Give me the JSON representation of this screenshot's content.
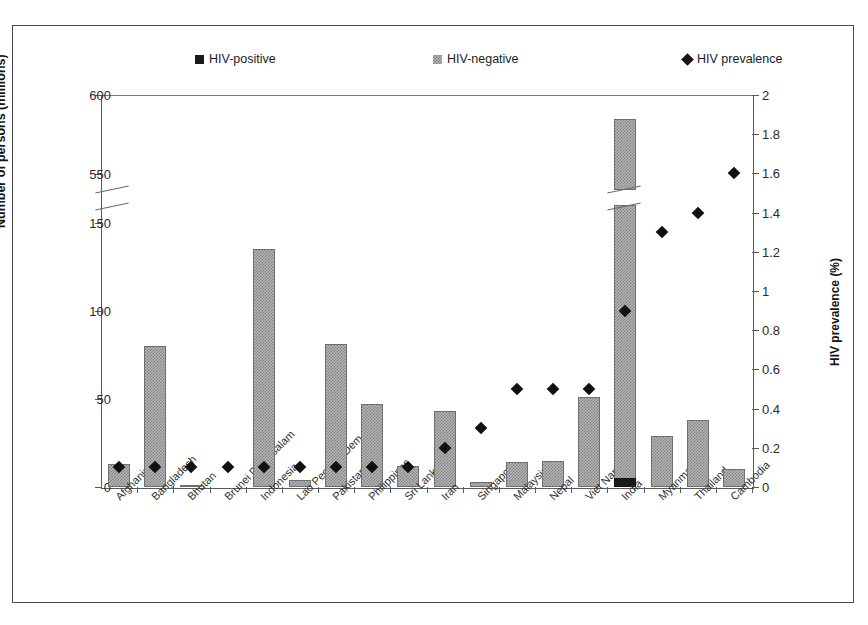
{
  "legend": {
    "items": [
      {
        "label": "HIV-positive",
        "icon": "black-square-icon",
        "color": "#1a1a1a"
      },
      {
        "label": "HIV-negative",
        "icon": "gray-hatched-square-icon",
        "color": "#b4b4b4"
      },
      {
        "label": "HIV prevalence",
        "icon": "black-diamond-icon",
        "color": "#111111"
      }
    ]
  },
  "axes": {
    "left_title": "Number of persons (millions)",
    "right_title": "HIV prevalence (%)",
    "left_ticks": [
      "0",
      "50",
      "100",
      "150",
      "550",
      "600"
    ],
    "right_ticks": [
      "0",
      "0.2",
      "0.4",
      "0.6",
      "0.8",
      "1",
      "1.2",
      "1.4",
      "1.6",
      "1.8",
      "2"
    ],
    "left_break_between": [
      "150",
      "550"
    ]
  },
  "chart_data": {
    "type": "bar",
    "title": "",
    "xlabel": "",
    "ylabel": "Number of persons (millions)",
    "y2label": "HIV prevalence (%)",
    "ylim": [
      0,
      600
    ],
    "y2lim": [
      0,
      2
    ],
    "axis_break": {
      "axis": "y",
      "from": 160,
      "to": 540
    },
    "grid": false,
    "legend_position": "top",
    "categories": [
      "Afghanistan",
      "Bangladesh",
      "Bhutan",
      "Brunei Darussalam",
      "Indonesia",
      "Lao Peoples Dem. Rep.",
      "Pakistan",
      "Philippines",
      "Sri Lanka",
      "Iran",
      "Singapore",
      "Malaysia",
      "Nepal",
      "Viet Nam",
      "India",
      "Myanmar",
      "Thailand",
      "Cambodia"
    ],
    "series": [
      {
        "name": "HIV-negative",
        "type": "bar",
        "axis": "left",
        "units": "millions",
        "values": [
          13,
          80,
          1,
          0,
          135,
          4,
          81,
          47,
          12,
          43,
          3,
          14,
          15,
          51,
          580,
          29,
          38,
          10
        ]
      },
      {
        "name": "HIV-positive",
        "type": "bar",
        "axis": "left",
        "units": "millions",
        "values": [
          0,
          0,
          0,
          0,
          0,
          0,
          0,
          0,
          0,
          0,
          0,
          0,
          0,
          0,
          5,
          0,
          0,
          0
        ]
      },
      {
        "name": "HIV prevalence",
        "type": "scatter",
        "axis": "right",
        "units": "%",
        "values": [
          0.1,
          0.1,
          0.1,
          0.1,
          0.1,
          0.1,
          0.1,
          0.1,
          0.1,
          0.2,
          0.3,
          0.5,
          0.5,
          0.5,
          0.9,
          1.3,
          1.4,
          1.6
        ]
      }
    ]
  }
}
